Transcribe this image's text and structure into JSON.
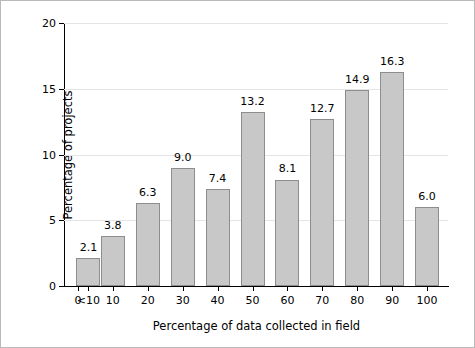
{
  "chart_data": {
    "type": "bar",
    "title": "",
    "subtitle": "",
    "xlabel": "Percentage of data collected in field",
    "ylabel": "Percentage of projects",
    "categories": [
      "<10",
      "10",
      "20",
      "30",
      "40",
      "50",
      "60",
      "70",
      "80",
      "90",
      "100"
    ],
    "values": [
      2.1,
      3.8,
      6.3,
      9.0,
      7.4,
      13.2,
      8.1,
      12.7,
      14.9,
      16.3,
      6.0
    ],
    "bar_positions": [
      3,
      10,
      20,
      30,
      40,
      50,
      60,
      70,
      80,
      90,
      100
    ],
    "data_labels": [
      "2.1",
      "3.8",
      "6.3",
      "9.0",
      "7.4",
      "13.2",
      "8.1",
      "12.7",
      "14.9",
      "16.3",
      "6.0"
    ],
    "xticks": [
      {
        "value": 0,
        "label": "0"
      },
      {
        "value": 3,
        "label": "<10"
      },
      {
        "value": 10,
        "label": "10"
      },
      {
        "value": 20,
        "label": "20"
      },
      {
        "value": 30,
        "label": "30"
      },
      {
        "value": 40,
        "label": "40"
      },
      {
        "value": 50,
        "label": "50"
      },
      {
        "value": 60,
        "label": "60"
      },
      {
        "value": 70,
        "label": "70"
      },
      {
        "value": 80,
        "label": "80"
      },
      {
        "value": 90,
        "label": "90"
      },
      {
        "value": 100,
        "label": "100"
      }
    ],
    "yticks": [
      {
        "value": 0,
        "label": "0"
      },
      {
        "value": 5,
        "label": "5"
      },
      {
        "value": 10,
        "label": "10"
      },
      {
        "value": 15,
        "label": "15"
      },
      {
        "value": 20,
        "label": "20"
      }
    ],
    "xlim": [
      -4,
      106
    ],
    "ylim": [
      0,
      20
    ],
    "grid": "horizontal",
    "legend": "none",
    "colors": {
      "bar_fill": "#c8c8c8",
      "bar_edge": "#8d8d8d",
      "gridline": "#e4e4e4",
      "axis": "#000000",
      "background": "#ffffff",
      "border": "#b9b9b9"
    }
  }
}
